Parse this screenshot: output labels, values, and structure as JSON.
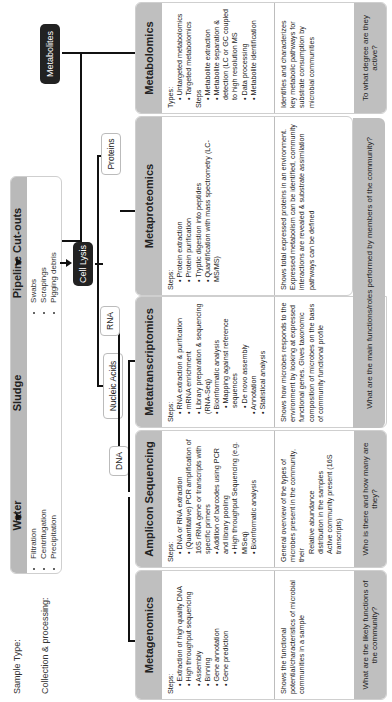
{
  "labels": {
    "sample_type": "Sample Type:",
    "collection": "Collection & processing:"
  },
  "samples": [
    {
      "name": "Water",
      "items": [
        "Filtration",
        "Centrifugation",
        "Precipitation"
      ]
    },
    {
      "name": "Sludge",
      "items": []
    },
    {
      "name": "Pipeline Cut-outs",
      "items": [
        "Swabs",
        "Scrapings",
        "Pigging debris"
      ]
    }
  ],
  "nodes": {
    "cell_lysis": "Cell Lysis",
    "nucleic_acids": "Nucleic Acids",
    "dna": "DNA",
    "rna": "RNA",
    "proteins": "Proteins",
    "metabolites": "Metabolites"
  },
  "cards": [
    {
      "title": "Metagenomics",
      "steps_label": "Steps:",
      "steps": [
        "Extraction of high quality DNA",
        "High throughput sequencing",
        "Assembly",
        "Binning",
        "Gene annotation",
        "Gene prediction"
      ],
      "description": "Shows the functional potential/characteristics of microbial communities in a sample",
      "question": "What are the likely functions of the community?"
    },
    {
      "title": "Amplicon Sequencing",
      "steps_label": "Steps:",
      "steps": [
        "DNA or RNA extraction",
        "(Quantitative) PCR amplification of 16S rRNA gene or transcripts with specific primers",
        "Addition of barcodes using PCR and library pooling",
        "High throughput Sequencing (e.g. MiSeq)",
        "Bioinformatic analysis"
      ],
      "description": "General overview of the types of microbes present in the community, their",
      "description_items": [
        "Relative abundance",
        "distribution in the samples",
        "Active community present (16S transcripts)"
      ],
      "question": "Who is there and how many are they?"
    },
    {
      "title": "Metatranscriptomics",
      "steps_label": "Steps:",
      "steps": [
        "RNA extraction & purification",
        "mRNA enrichment",
        "Library preparation & sequencing (RNA-Seq)",
        "Bioinformatic analysis"
      ],
      "sub_steps": [
        "Mapping against reference sequences",
        "De novo assembly"
      ],
      "steps_after": [
        "Annotation",
        "Statistical analysis"
      ],
      "description": "Shows how microbes responds to the environment by looking at expressed functional genes. Gives taxonomic composition of microbes on the basis of community functional profile",
      "question": "What are the main functions/roles performed by members of the community?"
    },
    {
      "title": "Metaproteomics",
      "steps_label": "Steps:",
      "steps": [
        "Protein extraction",
        "Protein purification",
        "Tryptic digestion into peptides",
        "Quantification with mass spectrometry (LC-MS/MS)"
      ],
      "description": "Shows total expressed proteins in an environment. Expressed metabolism can be identified, community interactions are revealed & substrate assimilation pathways can be defined"
    },
    {
      "title": "Metabolomics",
      "types_label": "Types:",
      "types": [
        "Untargeted metabolomics",
        "Targeted metabolomics"
      ],
      "steps_label": "Steps",
      "steps": [
        "Metabolite extraction",
        "Metabolite separation & detection (LC or GC coupled to high resolution MS",
        "Data processing",
        "Metabolite identification"
      ],
      "description": "Identifies and characterizes key metabolic pathways for substrate consumption by microbial communities",
      "question": "To what degree are they active?"
    }
  ],
  "colors": {
    "header_gray": "#bfbfbf",
    "dark_node": "#222222",
    "line": "#111111"
  }
}
